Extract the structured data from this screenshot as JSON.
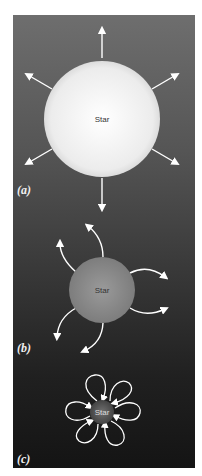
{
  "figure": {
    "panels": [
      {
        "id": "a",
        "label": "(a)",
        "star_label": "Star",
        "description": "Large star radiating straight outward arrows"
      },
      {
        "id": "b",
        "label": "(b)",
        "star_label": "Star",
        "description": "Medium star with curved outward arrows"
      },
      {
        "id": "c",
        "label": "(c)",
        "star_label": "Star",
        "description": "Small star with looping arrows returning inward"
      }
    ]
  },
  "colors": {
    "background_top": "#6e6e6e",
    "background_bottom": "#141414",
    "star_a": "#f2f2f2",
    "star_b": "#8c8c8c",
    "star_c": "#5a5a5a",
    "arrow": "#ffffff"
  }
}
